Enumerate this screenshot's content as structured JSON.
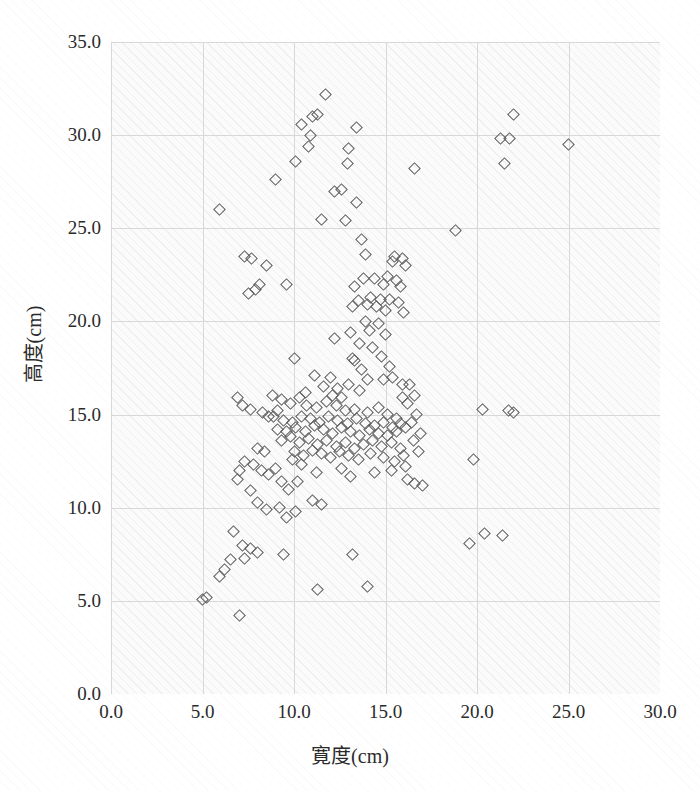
{
  "chart_data": {
    "type": "scatter",
    "title": "",
    "xlabel": "寛度(cm)",
    "ylabel": "高度(cm)",
    "xlim": [
      0.0,
      30.0
    ],
    "ylim": [
      0.0,
      35.0
    ],
    "xticks": [
      "0.0",
      "5.0",
      "10.0",
      "15.0",
      "20.0",
      "25.0",
      "30.0"
    ],
    "xtick_values": [
      0.0,
      5.0,
      10.0,
      15.0,
      20.0,
      25.0,
      30.0
    ],
    "yticks": [
      "0.0",
      "5.0",
      "10.0",
      "15.0",
      "20.0",
      "25.0",
      "30.0",
      "35.0"
    ],
    "ytick_values": [
      0.0,
      5.0,
      10.0,
      15.0,
      20.0,
      25.0,
      30.0,
      35.0
    ],
    "grid": true,
    "legend": "none",
    "marker": "open-diamond",
    "marker_color": "#5b5b5b",
    "background_color": "#fbfbfb",
    "gridline_color": "#d8d8d8",
    "series": [
      {
        "name": "samples",
        "points": [
          [
            11.7,
            32.2
          ],
          [
            11.3,
            31.1
          ],
          [
            11.0,
            31.0
          ],
          [
            22.0,
            31.1
          ],
          [
            10.4,
            30.6
          ],
          [
            13.4,
            30.4
          ],
          [
            10.9,
            30.0
          ],
          [
            21.3,
            29.8
          ],
          [
            21.8,
            29.8
          ],
          [
            10.8,
            29.4
          ],
          [
            13.0,
            29.3
          ],
          [
            25.0,
            29.5
          ],
          [
            10.1,
            28.6
          ],
          [
            12.9,
            28.5
          ],
          [
            16.6,
            28.2
          ],
          [
            21.5,
            28.5
          ],
          [
            9.0,
            27.6
          ],
          [
            12.2,
            27.0
          ],
          [
            12.6,
            27.1
          ],
          [
            13.4,
            26.4
          ],
          [
            5.9,
            26.0
          ],
          [
            11.5,
            25.5
          ],
          [
            12.8,
            25.4
          ],
          [
            18.8,
            24.9
          ],
          [
            13.7,
            24.4
          ],
          [
            7.3,
            23.5
          ],
          [
            7.7,
            23.4
          ],
          [
            8.5,
            23.0
          ],
          [
            13.9,
            23.6
          ],
          [
            15.5,
            23.5
          ],
          [
            15.9,
            23.4
          ],
          [
            15.4,
            23.2
          ],
          [
            16.1,
            23.0
          ],
          [
            8.1,
            22.0
          ],
          [
            9.6,
            22.0
          ],
          [
            13.8,
            22.3
          ],
          [
            14.4,
            22.3
          ],
          [
            15.1,
            22.4
          ],
          [
            15.6,
            22.2
          ],
          [
            7.5,
            21.5
          ],
          [
            7.9,
            21.7
          ],
          [
            13.3,
            21.9
          ],
          [
            14.9,
            22.0
          ],
          [
            15.8,
            21.9
          ],
          [
            13.5,
            21.1
          ],
          [
            14.2,
            21.3
          ],
          [
            14.7,
            21.2
          ],
          [
            15.2,
            21.2
          ],
          [
            15.7,
            21.0
          ],
          [
            14.0,
            20.9
          ],
          [
            14.5,
            20.8
          ],
          [
            15.0,
            20.6
          ],
          [
            13.2,
            20.8
          ],
          [
            16.0,
            20.5
          ],
          [
            13.9,
            20.0
          ],
          [
            14.6,
            19.9
          ],
          [
            14.1,
            19.5
          ],
          [
            15.0,
            19.3
          ],
          [
            13.6,
            18.8
          ],
          [
            14.3,
            18.6
          ],
          [
            13.2,
            18.0
          ],
          [
            14.8,
            18.1
          ],
          [
            15.2,
            17.6
          ],
          [
            10.0,
            18.0
          ],
          [
            15.4,
            17.0
          ],
          [
            15.9,
            16.6
          ],
          [
            11.1,
            17.1
          ],
          [
            12.0,
            17.0
          ],
          [
            11.6,
            16.5
          ],
          [
            12.4,
            16.4
          ],
          [
            13.0,
            16.6
          ],
          [
            13.6,
            16.3
          ],
          [
            6.9,
            15.9
          ],
          [
            7.2,
            15.5
          ],
          [
            7.6,
            15.3
          ],
          [
            9.3,
            15.8
          ],
          [
            9.8,
            15.6
          ],
          [
            10.3,
            15.9
          ],
          [
            10.7,
            15.5
          ],
          [
            11.2,
            15.4
          ],
          [
            11.8,
            15.7
          ],
          [
            12.3,
            15.5
          ],
          [
            12.8,
            15.2
          ],
          [
            13.3,
            15.3
          ],
          [
            14.0,
            15.1
          ],
          [
            14.6,
            15.4
          ],
          [
            15.1,
            15.0
          ],
          [
            15.6,
            14.8
          ],
          [
            8.9,
            14.9
          ],
          [
            9.4,
            14.7
          ],
          [
            9.9,
            14.6
          ],
          [
            10.4,
            14.9
          ],
          [
            10.9,
            14.8
          ],
          [
            11.4,
            14.6
          ],
          [
            11.9,
            14.9
          ],
          [
            12.4,
            14.7
          ],
          [
            12.9,
            14.5
          ],
          [
            13.4,
            14.8
          ],
          [
            13.9,
            14.5
          ],
          [
            14.4,
            14.4
          ],
          [
            14.9,
            14.6
          ],
          [
            15.4,
            14.3
          ],
          [
            15.8,
            14.5
          ],
          [
            9.1,
            14.2
          ],
          [
            9.6,
            14.1
          ],
          [
            10.1,
            14.3
          ],
          [
            10.6,
            14.1
          ],
          [
            11.1,
            14.4
          ],
          [
            11.6,
            14.2
          ],
          [
            12.1,
            14.0
          ],
          [
            12.6,
            14.3
          ],
          [
            13.1,
            14.1
          ],
          [
            13.6,
            13.9
          ],
          [
            14.1,
            14.2
          ],
          [
            14.6,
            14.0
          ],
          [
            15.1,
            13.9
          ],
          [
            15.6,
            14.1
          ],
          [
            16.1,
            14.3
          ],
          [
            9.3,
            13.6
          ],
          [
            9.8,
            13.8
          ],
          [
            10.3,
            13.5
          ],
          [
            10.8,
            13.7
          ],
          [
            11.3,
            13.4
          ],
          [
            11.8,
            13.6
          ],
          [
            12.3,
            13.3
          ],
          [
            12.8,
            13.5
          ],
          [
            13.3,
            13.2
          ],
          [
            13.8,
            13.4
          ],
          [
            14.3,
            13.6
          ],
          [
            14.8,
            13.3
          ],
          [
            15.3,
            13.5
          ],
          [
            15.8,
            13.2
          ],
          [
            10.0,
            13.0
          ],
          [
            10.5,
            12.8
          ],
          [
            11.0,
            13.1
          ],
          [
            11.5,
            12.9
          ],
          [
            12.0,
            12.7
          ],
          [
            12.5,
            13.0
          ],
          [
            13.0,
            12.8
          ],
          [
            13.5,
            12.6
          ],
          [
            14.2,
            12.9
          ],
          [
            14.9,
            12.7
          ],
          [
            15.5,
            12.5
          ],
          [
            16.0,
            12.8
          ],
          [
            16.4,
            14.6
          ],
          [
            16.5,
            13.6
          ],
          [
            16.8,
            13.0
          ],
          [
            8.3,
            15.1
          ],
          [
            8.6,
            14.9
          ],
          [
            8.0,
            13.2
          ],
          [
            8.4,
            13.0
          ],
          [
            7.8,
            12.3
          ],
          [
            8.2,
            12.0
          ],
          [
            8.6,
            11.8
          ],
          [
            9.0,
            12.1
          ],
          [
            7.3,
            12.5
          ],
          [
            7.0,
            12.0
          ],
          [
            6.9,
            11.5
          ],
          [
            9.3,
            11.4
          ],
          [
            9.7,
            11.0
          ],
          [
            10.2,
            11.4
          ],
          [
            16.2,
            11.5
          ],
          [
            16.6,
            11.3
          ],
          [
            17.0,
            11.2
          ],
          [
            11.0,
            10.4
          ],
          [
            11.5,
            10.2
          ],
          [
            7.6,
            10.9
          ],
          [
            8.0,
            10.3
          ],
          [
            8.5,
            9.9
          ],
          [
            9.2,
            10.0
          ],
          [
            9.6,
            9.5
          ],
          [
            10.1,
            9.8
          ],
          [
            6.7,
            8.7
          ],
          [
            7.2,
            8.0
          ],
          [
            7.6,
            7.8
          ],
          [
            8.0,
            7.6
          ],
          [
            7.3,
            7.3
          ],
          [
            6.5,
            7.2
          ],
          [
            6.2,
            6.7
          ],
          [
            5.9,
            6.3
          ],
          [
            9.4,
            7.5
          ],
          [
            13.2,
            7.5
          ],
          [
            5.2,
            5.2
          ],
          [
            5.0,
            5.1
          ],
          [
            11.3,
            5.6
          ],
          [
            14.0,
            5.8
          ],
          [
            7.0,
            4.2
          ],
          [
            19.6,
            8.1
          ],
          [
            20.4,
            8.6
          ],
          [
            21.4,
            8.5
          ],
          [
            19.8,
            12.6
          ],
          [
            20.3,
            15.3
          ],
          [
            21.7,
            15.2
          ],
          [
            22.0,
            15.1
          ],
          [
            12.1,
            16.0
          ],
          [
            12.6,
            15.9
          ],
          [
            10.6,
            16.2
          ],
          [
            16.3,
            16.6
          ],
          [
            16.7,
            15.0
          ],
          [
            15.3,
            12.0
          ],
          [
            16.1,
            12.2
          ],
          [
            14.4,
            11.9
          ],
          [
            13.1,
            11.7
          ],
          [
            12.6,
            12.1
          ],
          [
            11.2,
            11.9
          ],
          [
            10.4,
            12.3
          ],
          [
            9.9,
            12.6
          ],
          [
            16.9,
            14.0
          ],
          [
            8.8,
            16.0
          ],
          [
            9.1,
            15.2
          ],
          [
            12.2,
            19.1
          ],
          [
            13.1,
            19.4
          ],
          [
            14.9,
            16.9
          ],
          [
            15.9,
            15.9
          ],
          [
            16.2,
            15.6
          ],
          [
            16.6,
            16.0
          ],
          [
            14.0,
            16.9
          ],
          [
            13.7,
            17.4
          ],
          [
            13.3,
            17.9
          ]
        ]
      }
    ]
  }
}
